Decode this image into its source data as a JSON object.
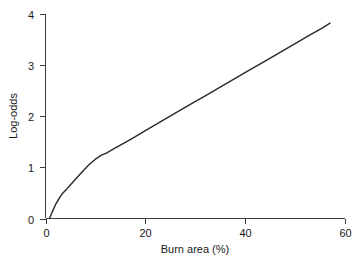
{
  "chart_data": {
    "type": "line",
    "title": "",
    "subtitle": "",
    "xlabel": "Burn area (%)",
    "ylabel": "Log-odds",
    "xlim": [
      0,
      60
    ],
    "ylim": [
      0,
      4
    ],
    "xticks": [
      0,
      20,
      40,
      60
    ],
    "yticks": [
      0,
      1,
      2,
      3,
      4
    ],
    "xtick_labels": [
      "0",
      "20",
      "40",
      "60"
    ],
    "ytick_labels": [
      "0",
      "1",
      "2",
      "3",
      "4"
    ],
    "grid": false,
    "legend": null,
    "legend_position": "none",
    "annotations": [],
    "series": [
      {
        "name": "Log-odds vs burn area",
        "color": "#2b2b2b",
        "line_width": 1.45,
        "points": [
          {
            "x": 0.8,
            "y": 0.0
          },
          {
            "x": 1.4,
            "y": 0.14
          },
          {
            "x": 2.0,
            "y": 0.27
          },
          {
            "x": 2.7,
            "y": 0.39
          },
          {
            "x": 3.4,
            "y": 0.49
          },
          {
            "x": 4.1,
            "y": 0.56
          },
          {
            "x": 5.2,
            "y": 0.68
          },
          {
            "x": 6.4,
            "y": 0.81
          },
          {
            "x": 7.6,
            "y": 0.94
          },
          {
            "x": 8.8,
            "y": 1.06
          },
          {
            "x": 10.0,
            "y": 1.16
          },
          {
            "x": 11.2,
            "y": 1.24
          },
          {
            "x": 12.2,
            "y": 1.28
          },
          {
            "x": 14.0,
            "y": 1.38
          },
          {
            "x": 16.0,
            "y": 1.49
          },
          {
            "x": 18.0,
            "y": 1.6
          },
          {
            "x": 20.0,
            "y": 1.72
          },
          {
            "x": 23.0,
            "y": 1.89
          },
          {
            "x": 26.0,
            "y": 2.06
          },
          {
            "x": 29.0,
            "y": 2.23
          },
          {
            "x": 32.0,
            "y": 2.4
          },
          {
            "x": 35.0,
            "y": 2.57
          },
          {
            "x": 38.0,
            "y": 2.74
          },
          {
            "x": 41.0,
            "y": 2.91
          },
          {
            "x": 44.0,
            "y": 3.08
          },
          {
            "x": 47.0,
            "y": 3.25
          },
          {
            "x": 50.0,
            "y": 3.42
          },
          {
            "x": 53.0,
            "y": 3.59
          },
          {
            "x": 55.5,
            "y": 3.73
          },
          {
            "x": 57.0,
            "y": 3.82
          }
        ]
      }
    ]
  },
  "axes": {
    "x_axis_name": "x-axis",
    "y_axis_name": "y-axis"
  },
  "colors": {
    "background": "#ffffff",
    "axis": "#3b3b3b",
    "curve": "#2b2b2b",
    "text": "#1a1a1a"
  }
}
